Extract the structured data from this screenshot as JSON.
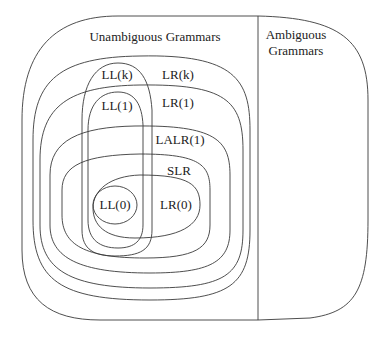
{
  "diagram": {
    "type": "nested-set-diagram",
    "line_color": "#3a3a3a",
    "regions": {
      "unambiguous": {
        "label": "Unambiguous Grammars"
      },
      "ambiguous": {
        "label_line1": "Ambiguous",
        "label_line2": "Grammars"
      }
    },
    "sets": {
      "lrk": {
        "label": "LR(k)"
      },
      "llk": {
        "label": "LL(k)"
      },
      "lr1": {
        "label": "LR(1)"
      },
      "ll1": {
        "label": "LL(1)"
      },
      "lalr1": {
        "label": "LALR(1)"
      },
      "slr": {
        "label": "SLR"
      },
      "lr0": {
        "label": "LR(0)"
      },
      "ll0": {
        "label": "LL(0)"
      }
    },
    "containment": [
      "LR(0) ⊂ SLR ⊂ LALR(1) ⊂ LR(1) ⊂ LR(k) ⊂ Unambiguous Grammars",
      "LL(0) ⊂ LL(1) ⊂ LL(k) ⊂ LR(k)",
      "LL(1) ⊂ LR(1)",
      "LL(0) ⊂ LR(0)"
    ]
  }
}
